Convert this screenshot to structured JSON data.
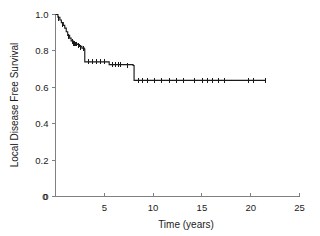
{
  "figure": {
    "background_color": "#ffffff",
    "curve_color": "#1a1a1a",
    "axis_color": "#808080"
  },
  "chart_data": {
    "type": "line",
    "subtype": "kaplan-meier-step",
    "title": "",
    "subtitle": "",
    "xlabel": "Time (years)",
    "ylabel": "Local Disease Free Survival",
    "xlim": [
      0,
      25
    ],
    "ylim": [
      0,
      1.0
    ],
    "grid": false,
    "legend": false,
    "legend_position": "none",
    "xticks": [
      0,
      5,
      10,
      15,
      20,
      25
    ],
    "xtick_labels": [
      "0",
      "5",
      "10",
      "15",
      "20",
      "25"
    ],
    "yticks": [
      0,
      0.2,
      0.4,
      0.6,
      0.8,
      1.0
    ],
    "ytick_labels": [
      "0",
      "0.2",
      "0.4",
      "0.6",
      "0.8",
      "1.0"
    ],
    "series": [
      {
        "name": "Local Disease Free Survival",
        "color": "#1a1a1a",
        "step": "post",
        "x": [
          0.0,
          0.25,
          0.45,
          0.6,
          0.8,
          0.95,
          1.1,
          1.25,
          1.45,
          1.6,
          1.8,
          2.0,
          2.2,
          2.45,
          2.7,
          2.95,
          3.0,
          5.3,
          5.5,
          6.9,
          7.95,
          8.05,
          21.5
        ],
        "y": [
          1.0,
          0.985,
          0.97,
          0.955,
          0.94,
          0.925,
          0.905,
          0.885,
          0.87,
          0.855,
          0.845,
          0.84,
          0.835,
          0.825,
          0.815,
          0.81,
          0.74,
          0.74,
          0.725,
          0.725,
          0.72,
          0.638,
          0.638
        ]
      }
    ],
    "censored_points": [
      {
        "x": 0.35,
        "y": 0.977
      },
      {
        "x": 0.7,
        "y": 0.947
      },
      {
        "x": 1.35,
        "y": 0.877
      },
      {
        "x": 1.7,
        "y": 0.85
      },
      {
        "x": 1.9,
        "y": 0.842
      },
      {
        "x": 2.1,
        "y": 0.838
      },
      {
        "x": 2.35,
        "y": 0.83
      },
      {
        "x": 2.6,
        "y": 0.82
      },
      {
        "x": 2.85,
        "y": 0.812
      },
      {
        "x": 3.35,
        "y": 0.74
      },
      {
        "x": 3.75,
        "y": 0.74
      },
      {
        "x": 4.2,
        "y": 0.74
      },
      {
        "x": 4.65,
        "y": 0.74
      },
      {
        "x": 5.05,
        "y": 0.74
      },
      {
        "x": 5.85,
        "y": 0.725
      },
      {
        "x": 6.15,
        "y": 0.725
      },
      {
        "x": 6.45,
        "y": 0.725
      },
      {
        "x": 6.7,
        "y": 0.725
      },
      {
        "x": 7.4,
        "y": 0.72
      },
      {
        "x": 8.5,
        "y": 0.638
      },
      {
        "x": 8.9,
        "y": 0.638
      },
      {
        "x": 9.4,
        "y": 0.638
      },
      {
        "x": 10.1,
        "y": 0.638
      },
      {
        "x": 10.9,
        "y": 0.638
      },
      {
        "x": 11.7,
        "y": 0.638
      },
      {
        "x": 12.4,
        "y": 0.638
      },
      {
        "x": 13.1,
        "y": 0.638
      },
      {
        "x": 14.2,
        "y": 0.638
      },
      {
        "x": 15.1,
        "y": 0.638
      },
      {
        "x": 15.6,
        "y": 0.638
      },
      {
        "x": 16.1,
        "y": 0.638
      },
      {
        "x": 16.7,
        "y": 0.638
      },
      {
        "x": 17.3,
        "y": 0.638
      },
      {
        "x": 19.8,
        "y": 0.638
      },
      {
        "x": 20.3,
        "y": 0.638
      },
      {
        "x": 21.5,
        "y": 0.638
      }
    ]
  }
}
